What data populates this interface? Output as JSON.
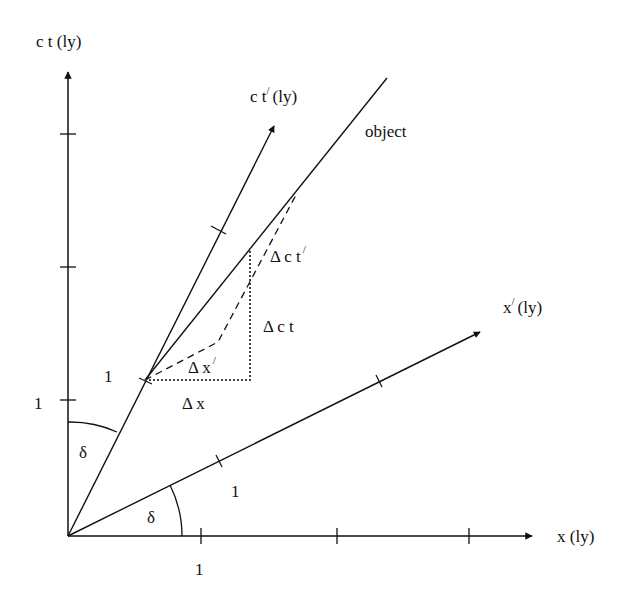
{
  "diagram": {
    "type": "minkowski-spacetime-diagram",
    "axes": {
      "ct": {
        "label": "c t (ly)"
      },
      "x": {
        "label": "x (ly)"
      },
      "ct_prime": {
        "label_main": "c t",
        "prime": "/",
        "label_unit": "(ly)"
      },
      "x_prime": {
        "label_main": "x",
        "prime": "/",
        "label_unit": "(ly)"
      }
    },
    "tick_labels": {
      "ct_one": "1",
      "x_one": "1",
      "ct_prime_one": "1",
      "x_prime_one": "1"
    },
    "object_label": "object",
    "angle_labels": {
      "delta_top": "δ",
      "delta_bottom": "δ"
    },
    "intervals": {
      "delta_x": "Δ x",
      "delta_ct": "Δ c t",
      "delta_x_prime_main": "Δ x",
      "delta_x_prime_mark": "/",
      "delta_ct_prime_main": "Δ c t",
      "delta_ct_prime_mark": "/"
    },
    "colors": {
      "line": "#111111",
      "dotted": "#555555",
      "background": "#ffffff"
    }
  }
}
